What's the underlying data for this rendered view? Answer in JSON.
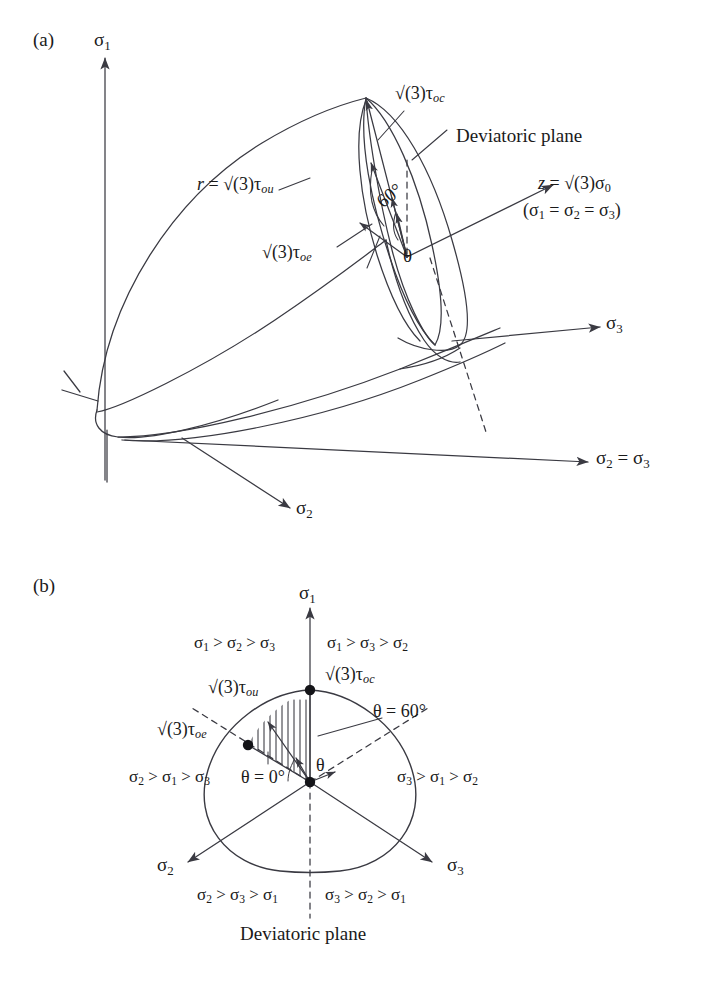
{
  "figure": {
    "type": "technical-diagram",
    "background": "#ffffff",
    "line_color": "#3a3a42",
    "marker_color": "#1a1a1a"
  },
  "panel_a": {
    "tag": "(a)",
    "axes": [
      {
        "name": "sigma1-axis",
        "label_base": "σ",
        "label_sub": "1"
      },
      {
        "name": "sigma3-axis",
        "label_base": "σ",
        "label_sub": "3"
      },
      {
        "name": "sigma2-axis",
        "label_base": "σ",
        "label_sub": "2"
      }
    ],
    "labels": {
      "sigma1": "σ1",
      "sigma2": "σ2",
      "sigma3": "σ3",
      "sigma2_eq_sigma3": "σ2 = σ3",
      "r_tau_ou": "r = √(3)τou",
      "tau_oc": "√(3)τoc",
      "tau_oe": "√(3)τoe",
      "deviatoric_plane": "Deviatoric plane",
      "z_axis_line1": "z = √(3)σ0",
      "z_axis_line2": "(σ1 = σ2 = σ3)",
      "angle_60": "60°",
      "theta": "θ"
    }
  },
  "panel_b": {
    "tag": "(b)",
    "labels": {
      "sigma1": "σ1",
      "sigma2": "σ2",
      "sigma3": "σ3",
      "tau_oc": "√(3)τoc",
      "tau_ou": "√(3)τou",
      "tau_oe": "√(3)τoe",
      "theta_60": "θ = 60°",
      "theta_0": "θ = 0°",
      "theta": "θ",
      "deviatoric_plane": "Deviatoric plane"
    },
    "sector_inequalities": [
      {
        "id": "top-left",
        "text": "σ1 > σ2 > σ3"
      },
      {
        "id": "top-right",
        "text": "σ1 > σ3 > σ2"
      },
      {
        "id": "mid-left",
        "text": "σ2 > σ1 > σ3"
      },
      {
        "id": "mid-right",
        "text": "σ3 > σ1 > σ2"
      },
      {
        "id": "bottom-left",
        "text": "σ2 > σ3 > σ1"
      },
      {
        "id": "bottom-right",
        "text": "σ3 > σ2 > σ1"
      }
    ]
  }
}
